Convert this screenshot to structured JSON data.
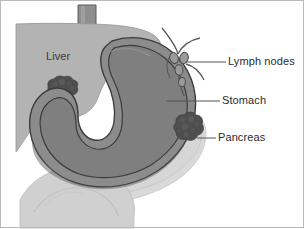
{
  "figure": {
    "type": "medical-anatomical-diagram",
    "background_color": "#ffffff",
    "border_color": "#b9b9b9"
  },
  "labels": {
    "liver": "Liver",
    "lymph_nodes": "Lymph nodes",
    "stomach": "Stomach",
    "pancreas": "Pancreas"
  },
  "structures": [
    {
      "name": "esophagus",
      "label": "",
      "fill": "#8e8e8e",
      "outline": "#5a5a5a"
    },
    {
      "name": "liver",
      "label": "Liver",
      "fill": "#b3b3b3",
      "outline": "#8a8a8a"
    },
    {
      "name": "stomach",
      "label": "Stomach",
      "fill": "#7f7f7f",
      "wall_fill": "#8c8c8c",
      "outline": "#3c3c3c"
    },
    {
      "name": "pancreas",
      "label": "Pancreas",
      "fill": "#d6d6d6",
      "outline": "#bdbdbd"
    },
    {
      "name": "lymph-node-chain",
      "label": "Lymph nodes",
      "fill": "#9a9a9a",
      "outline": "#4a4a4a"
    },
    {
      "name": "intestine",
      "label": "",
      "fill": "#d0d0d0",
      "outline": "#b0b0b0"
    },
    {
      "name": "tumor-liver",
      "label": "",
      "fill": "#4f4f4f",
      "outline": "#3a3a3a"
    },
    {
      "name": "tumor-stomach",
      "label": "",
      "fill": "#4f4f4f",
      "outline": "#3a3a3a"
    }
  ],
  "leader_lines": [
    {
      "name": "leader-lymph-nodes",
      "from_x": 186,
      "from_y": 62,
      "to_x": 226,
      "to_y": 62
    },
    {
      "name": "leader-stomach",
      "from_x": 166,
      "from_y": 101,
      "to_x": 220,
      "to_y": 101
    },
    {
      "name": "leader-pancreas",
      "from_x": 196,
      "from_y": 138,
      "to_x": 216,
      "to_y": 138
    }
  ]
}
